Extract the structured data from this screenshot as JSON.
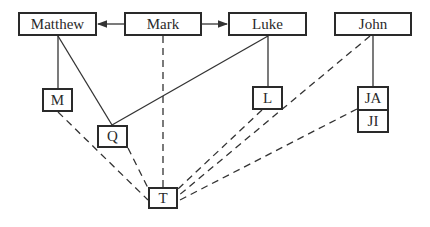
{
  "diagram": {
    "type": "synoptic-source-relationship-diagram",
    "nodes": {
      "matthew": "Matthew",
      "mark": "Mark",
      "luke": "Luke",
      "john": "John",
      "m": "M",
      "q": "Q",
      "l": "L",
      "ja": "JA",
      "ji": "JI",
      "t": "T"
    },
    "edges": [
      {
        "from": "Mark",
        "to": "Matthew",
        "style": "solid-arrow"
      },
      {
        "from": "Mark",
        "to": "Luke",
        "style": "solid-arrow"
      },
      {
        "from": "Matthew",
        "to": "M",
        "style": "solid"
      },
      {
        "from": "Matthew",
        "to": "Q",
        "style": "solid"
      },
      {
        "from": "Luke",
        "to": "Q",
        "style": "solid"
      },
      {
        "from": "Luke",
        "to": "L",
        "style": "solid"
      },
      {
        "from": "John",
        "to": "JA",
        "style": "solid"
      },
      {
        "from": "Mark",
        "to": "T",
        "style": "dashed"
      },
      {
        "from": "M",
        "to": "T",
        "style": "dashed"
      },
      {
        "from": "Q",
        "to": "T",
        "style": "dashed"
      },
      {
        "from": "L",
        "to": "T",
        "style": "dashed"
      },
      {
        "from": "John",
        "to": "T",
        "style": "dashed"
      },
      {
        "from": "JI",
        "to": "T",
        "style": "dashed"
      }
    ],
    "colors": {
      "stroke": "#2a2a2a",
      "background": "#ffffff"
    }
  }
}
